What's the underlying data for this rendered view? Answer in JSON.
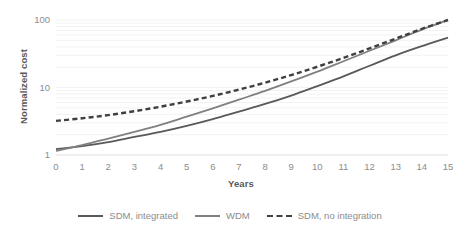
{
  "chart_data": {
    "type": "line",
    "title": "",
    "xlabel": "Years",
    "ylabel": "Normalized cost",
    "yscale": "log",
    "ylim": [
      1,
      100
    ],
    "xlim": [
      0,
      15
    ],
    "grid": "horizontal-faint",
    "legend_position": "bottom-center",
    "x": [
      0,
      1,
      2,
      3,
      4,
      5,
      6,
      7,
      8,
      9,
      10,
      11,
      12,
      13,
      14,
      15
    ],
    "xticklabels": [
      "0",
      "1",
      "2",
      "3",
      "4",
      "5",
      "6",
      "7",
      "8",
      "9",
      "10",
      "11",
      "12",
      "13",
      "14",
      "15"
    ],
    "yticklabels": [
      "1",
      "10",
      "100"
    ],
    "yticks": [
      1,
      10,
      100
    ],
    "series": [
      {
        "name": "SDM, integrated",
        "style": "solid",
        "color": "#595959",
        "values": [
          1.22,
          1.35,
          1.55,
          1.85,
          2.2,
          2.7,
          3.4,
          4.4,
          5.7,
          7.6,
          10.5,
          14.6,
          21.0,
          30.0,
          41.0,
          55.0
        ]
      },
      {
        "name": "WDM",
        "style": "solid",
        "color": "#808080",
        "values": [
          1.15,
          1.4,
          1.75,
          2.2,
          2.8,
          3.7,
          4.9,
          6.6,
          8.9,
          12.3,
          17.2,
          24.5,
          35.0,
          50.0,
          72.0,
          100.0
        ]
      },
      {
        "name": "SDM, no integration",
        "style": "dashed",
        "color": "#404040",
        "values": [
          3.2,
          3.5,
          3.9,
          4.45,
          5.2,
          6.2,
          7.5,
          9.3,
          11.8,
          15.3,
          20.3,
          27.5,
          38.0,
          53.0,
          74.0,
          100.0
        ]
      }
    ]
  },
  "legend": {
    "items": [
      {
        "label": "SDM, integrated"
      },
      {
        "label": "WDM"
      },
      {
        "label": "SDM, no integration"
      }
    ]
  }
}
